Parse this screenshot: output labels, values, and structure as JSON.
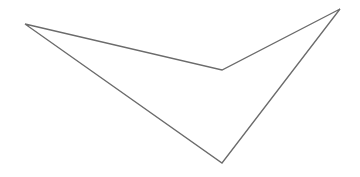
{
  "diagram": {
    "shape": "concave-quadrilateral",
    "stroke_color": "#6b6b6b",
    "fill_color": "#ffffff",
    "stroke_width": 1.3,
    "vertices": [
      {
        "x": 25,
        "y": 24
      },
      {
        "x": 222,
        "y": 70
      },
      {
        "x": 340,
        "y": 9
      },
      {
        "x": 222,
        "y": 163
      }
    ]
  }
}
